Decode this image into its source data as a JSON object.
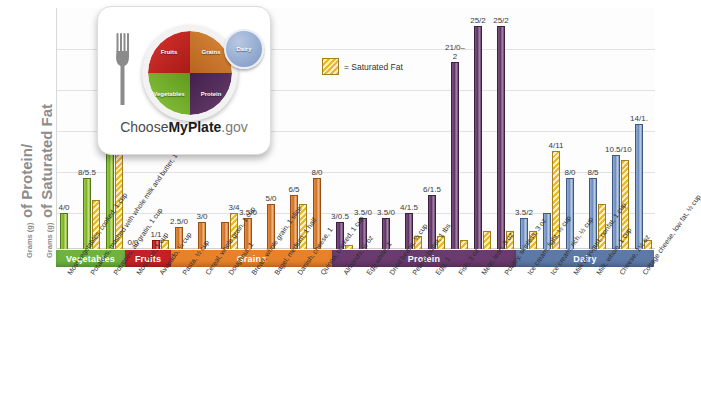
{
  "axis": {
    "y_title_line1_prefix": "Grams (g)",
    "y_title_line1_main": "of Protein/",
    "y_title_line2_prefix": "Grams (g)",
    "y_title_line2_main": "of Saturated Fat"
  },
  "legend": {
    "swatch_name": "saturated-fat-swatch",
    "text": "= Saturated Fat"
  },
  "logo": {
    "fruits": "Fruits",
    "grains": "Grains",
    "vegetables": "Vegetables",
    "protein": "Protein",
    "dairy": "Dairy",
    "wordmark_1": "Choose",
    "wordmark_2": "MyPlate",
    "wordmark_3": ".gov"
  },
  "categories": [
    {
      "label": "Vegetables",
      "color": "#6cb33f"
    },
    {
      "label": "Fruits",
      "color": "#c62026"
    },
    {
      "label": "Grains",
      "color": "#e8822a"
    },
    {
      "label": "Protein",
      "color": "#6b3a6e"
    },
    {
      "label": "Dairy",
      "color": "#5d79a8"
    }
  ],
  "chart_data": {
    "type": "bar",
    "xlabel": "",
    "ylabel": "Grams (g) of Protein/Grams (g) of Saturated Fat",
    "ylim": [
      0,
      27
    ],
    "grid": true,
    "legend_position": "top-center",
    "series": [
      {
        "name": "Protein (g)",
        "key": "protein"
      },
      {
        "name": "Saturated Fat (g)",
        "key": "fat"
      }
    ],
    "categories": [
      "Most vegetables, cooked, 1 cup",
      "Potatoes, mashed with whole milk and butter, 1 cup",
      "Potatoes, au gratin, 1 cup",
      "Most fruit, 1 cup",
      "Avocado, ¼ cup",
      "Pasta, ½ cup",
      "Cereal, whole grain, 1 cup",
      "Doughnut, 1",
      "Bread, whole grain, 1 slice",
      "Bagel, medium, 1 half",
      "Danish, cheese, 1",
      "Quinoa, cooked, 1 cup",
      "Almonds, ½ oz",
      "Egg white, 1",
      "Dried beans, ½ cup",
      "Peanut butter, 1 tbs",
      "Egg, 1",
      "Fish, 3 oz",
      "Meat, lean, 3 oz",
      "Poultry, skinless, 3 oz",
      "Ice cream, light, ½ cup",
      "Ice cream, rich, ½ cup",
      "Milk or yogurt, nonfat, 1 cup",
      "Milk, whole, 1 cup",
      "Cheese, 1½ oz",
      "Cottage cheese, low fat, ½ cup"
    ],
    "bars": [
      {
        "group": "Vegetables",
        "food": "Most vegetables, cooked, 1 cup",
        "label": "4/0",
        "protein": 4,
        "fat": 0
      },
      {
        "group": "Vegetables",
        "food": "Potatoes, mashed with whole milk and butter, 1 cup",
        "label": "8/5.5",
        "protein": 8,
        "fat": 5.5
      },
      {
        "group": "Vegetables",
        "food": "Potatoes, au gratin, 1 cup",
        "label": "12/11.5",
        "protein": 12,
        "fat": 11.5
      },
      {
        "group": "Fruits",
        "food": "Most fruit, 1 cup",
        "label": "0/0",
        "protein": 0,
        "fat": 0
      },
      {
        "group": "Fruits",
        "food": "Avocado, ¼ cup",
        "label": "1/1",
        "protein": 1,
        "fat": 1
      },
      {
        "group": "Grains",
        "food": "Pasta, ½ cup",
        "label": "2.5/0",
        "protein": 2.5,
        "fat": 0
      },
      {
        "group": "Grains",
        "food": "Cereal, whole grain, 1 cup",
        "label": "3/0",
        "protein": 3,
        "fat": 0
      },
      {
        "group": "Grains",
        "food": "Doughnut, 1",
        "label": "3/4",
        "protein": 3,
        "fat": 4
      },
      {
        "group": "Grains",
        "food": "Bread, whole grain, 1 slice",
        "label": "3.5/0",
        "protein": 3.5,
        "fat": 0
      },
      {
        "group": "Grains",
        "food": "Bagel, medium, 1 half",
        "label": "5/0",
        "protein": 5,
        "fat": 0
      },
      {
        "group": "Grains",
        "food": "Danish, cheese, 1",
        "label": "6/5",
        "protein": 6,
        "fat": 5
      },
      {
        "group": "Grains",
        "food": "Quinoa, cooked, 1 cup",
        "label": "8/0",
        "protein": 8,
        "fat": 0
      },
      {
        "group": "Protein",
        "food": "Almonds, ½ oz",
        "label": "3/0.5",
        "protein": 3,
        "fat": 0.5
      },
      {
        "group": "Protein",
        "food": "Egg white, 1",
        "label": "3.5/0",
        "protein": 3.5,
        "fat": 0
      },
      {
        "group": "Protein",
        "food": "Dried beans, ½ cup",
        "label": "3.5/0",
        "protein": 3.5,
        "fat": 0
      },
      {
        "group": "Protein",
        "food": "Peanut butter, 1 tbs",
        "label": "4/1.5",
        "protein": 4,
        "fat": 1.5
      },
      {
        "group": "Protein",
        "food": "Egg, 1",
        "label": "6/1.5",
        "protein": 6,
        "fat": 1.5
      },
      {
        "group": "Protein",
        "food": "Fish, 3 oz",
        "label": "21/0–2",
        "protein": 21,
        "fat": 1
      },
      {
        "group": "Protein",
        "food": "Meat, lean, 3 oz",
        "label": "25/2",
        "protein": 25,
        "fat": 2
      },
      {
        "group": "Protein",
        "food": "Poultry, skinless, 3 oz",
        "label": "25/2",
        "protein": 25,
        "fat": 2
      },
      {
        "group": "Dairy",
        "food": "Ice cream, light, ½ cup",
        "label": "3.5/2",
        "protein": 3.5,
        "fat": 2
      },
      {
        "group": "Dairy",
        "food": "Ice cream, rich, ½ cup",
        "label": "4/11",
        "protein": 4,
        "fat": 11
      },
      {
        "group": "Dairy",
        "food": "Milk or yogurt, nonfat, 1 cup",
        "label": "8/0",
        "protein": 8,
        "fat": 0
      },
      {
        "group": "Dairy",
        "food": "Milk, whole, 1 cup",
        "label": "8/5",
        "protein": 8,
        "fat": 5
      },
      {
        "group": "Dairy",
        "food": "Cheese, 1½ oz",
        "label": "10.5/10",
        "protein": 10.5,
        "fat": 10
      },
      {
        "group": "Dairy",
        "food": "Cottage cheese, low fat, ½ cup",
        "label": "14/1.",
        "protein": 14,
        "fat": 1
      }
    ]
  }
}
